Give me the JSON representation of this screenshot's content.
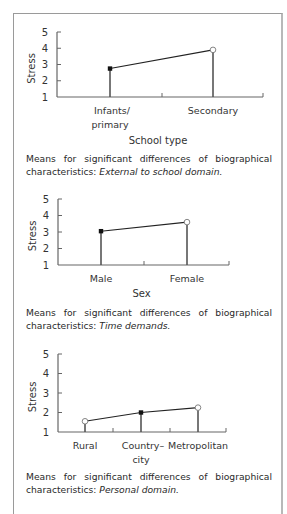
{
  "top_fragment": "graph",
  "chart_data": [
    {
      "type": "line",
      "title": "",
      "xlabel": "School type",
      "ylabel": "Stress",
      "ylim": [
        1,
        5
      ],
      "yticks": [
        "1",
        "2",
        "3",
        "4",
        "5"
      ],
      "categories": [
        "Infants/ primary",
        "Secondary"
      ],
      "category_lines": [
        [
          "Infants/",
          "primary"
        ],
        [
          "Secondary"
        ]
      ],
      "values": [
        2.75,
        3.9
      ],
      "markers": [
        "filled-square",
        "open-circle"
      ],
      "caption_lead": "Means for significant differences of biographical",
      "caption_tail": "characteristics: ",
      "caption_italic": "External to school domain."
    },
    {
      "type": "line",
      "title": "",
      "xlabel": "Sex",
      "ylabel": "Stress",
      "ylim": [
        1,
        5
      ],
      "yticks": [
        "1",
        "2",
        "3",
        "4",
        "5"
      ],
      "categories": [
        "Male",
        "Female"
      ],
      "category_lines": [
        [
          "Male"
        ],
        [
          "Female"
        ]
      ],
      "values": [
        3.05,
        3.6
      ],
      "markers": [
        "filled-square",
        "open-circle"
      ],
      "caption_lead": "Means for significant differences of biographical",
      "caption_tail": "characteristics: ",
      "caption_italic": "Time demands."
    },
    {
      "type": "line",
      "title": "",
      "xlabel": "",
      "ylabel": "Stress",
      "ylim": [
        1,
        5
      ],
      "yticks": [
        "1",
        "2",
        "3",
        "4",
        "5"
      ],
      "categories": [
        "Rural",
        "Country– city",
        "Metropolitan"
      ],
      "category_lines": [
        [
          "Rural"
        ],
        [
          "Country–",
          "city"
        ],
        [
          "Metropolitan"
        ]
      ],
      "values": [
        1.55,
        2.0,
        2.25
      ],
      "markers": [
        "open-circle",
        "filled-square",
        "open-circle"
      ],
      "caption_lead": "Means for significant differences of biographical",
      "caption_tail": "characteristics: ",
      "caption_italic": "Personal domain."
    }
  ]
}
